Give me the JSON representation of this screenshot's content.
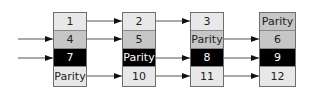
{
  "diagram": {
    "type": "parity-striping",
    "columns": [
      {
        "cells": [
          {
            "label": "1",
            "shade": "light"
          },
          {
            "label": "4",
            "shade": "mid"
          },
          {
            "label": "7",
            "shade": "dark"
          },
          {
            "label": "Parity",
            "shade": "light"
          }
        ]
      },
      {
        "cells": [
          {
            "label": "2",
            "shade": "light"
          },
          {
            "label": "5",
            "shade": "mid"
          },
          {
            "label": "Parity",
            "shade": "dark"
          },
          {
            "label": "10",
            "shade": "light"
          }
        ]
      },
      {
        "cells": [
          {
            "label": "3",
            "shade": "light"
          },
          {
            "label": "Parity",
            "shade": "mid"
          },
          {
            "label": "8",
            "shade": "dark"
          },
          {
            "label": "11",
            "shade": "light"
          }
        ]
      },
      {
        "cells": [
          {
            "label": "Parity",
            "shade": "mid"
          },
          {
            "label": "6",
            "shade": "mid"
          },
          {
            "label": "9",
            "shade": "dark"
          },
          {
            "label": "12",
            "shade": "light"
          }
        ]
      }
    ],
    "arrows": {
      "incoming_rows": [
        1,
        2
      ],
      "col1_to_col2_rows": [
        0,
        1,
        3
      ],
      "col2_to_col3_rows": [
        0,
        2,
        3
      ],
      "col3_to_col4_rows": [
        1,
        2,
        3
      ]
    },
    "colors": {
      "light": "#e8e8e8",
      "mid": "#c6c6c6",
      "dark": "#000000",
      "border": "#6e6e6e",
      "arrow": "#555555"
    }
  }
}
